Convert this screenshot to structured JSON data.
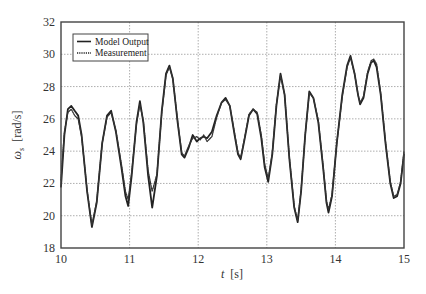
{
  "chart_data": {
    "type": "line",
    "title": "",
    "xlabel_italic": "t",
    "xlabel_unit": "[s]",
    "ylabel_symbol": "ω",
    "ylabel_sub": "s",
    "ylabel_unit": "[rad/s]",
    "xlim": [
      10,
      15
    ],
    "ylim": [
      18,
      32
    ],
    "xticks": [
      10,
      11,
      12,
      13,
      14,
      15
    ],
    "yticks": [
      18,
      20,
      22,
      24,
      26,
      28,
      30,
      32
    ],
    "grid": true,
    "legend_position": "upper left",
    "legend": [
      "Model Output",
      "Measurement"
    ],
    "series": [
      {
        "name": "Model Output",
        "style": "solid",
        "x": [
          10.0,
          10.05,
          10.1,
          10.15,
          10.2,
          10.25,
          10.3,
          10.38,
          10.45,
          10.52,
          10.6,
          10.67,
          10.73,
          10.8,
          10.88,
          10.94,
          10.98,
          11.03,
          11.1,
          11.15,
          11.2,
          11.27,
          11.33,
          11.4,
          11.47,
          11.53,
          11.58,
          11.63,
          11.7,
          11.76,
          11.8,
          11.86,
          11.92,
          11.98,
          12.03,
          12.08,
          12.13,
          12.2,
          12.27,
          12.34,
          12.4,
          12.46,
          12.53,
          12.58,
          12.62,
          12.68,
          12.74,
          12.8,
          12.86,
          12.92,
          12.97,
          13.02,
          13.08,
          13.14,
          13.2,
          13.26,
          13.33,
          13.4,
          13.45,
          13.5,
          13.56,
          13.62,
          13.68,
          13.75,
          13.82,
          13.87,
          13.9,
          13.95,
          14.02,
          14.1,
          14.17,
          14.22,
          14.28,
          14.33,
          14.36,
          14.41,
          14.47,
          14.52,
          14.56,
          14.6,
          14.66,
          14.73,
          14.8,
          14.85,
          14.9,
          14.95,
          15.0
        ],
        "y": [
          21.8,
          25.0,
          26.6,
          26.8,
          26.5,
          26.2,
          25.0,
          21.5,
          19.3,
          20.8,
          24.5,
          26.2,
          26.5,
          25.2,
          23.0,
          21.2,
          20.6,
          22.5,
          25.8,
          27.1,
          25.8,
          22.5,
          20.5,
          22.5,
          26.5,
          28.8,
          29.3,
          28.5,
          25.8,
          23.8,
          23.6,
          24.2,
          25.0,
          24.6,
          24.8,
          24.9,
          24.8,
          25.2,
          26.2,
          27.0,
          27.3,
          26.8,
          25.0,
          23.8,
          23.5,
          24.8,
          26.2,
          26.6,
          26.3,
          24.8,
          23.0,
          22.1,
          23.8,
          26.8,
          28.8,
          27.5,
          23.5,
          20.5,
          19.6,
          21.5,
          25.0,
          27.7,
          27.3,
          25.8,
          23.0,
          20.8,
          20.2,
          21.2,
          24.5,
          27.5,
          29.3,
          29.9,
          28.8,
          27.5,
          26.9,
          27.3,
          28.8,
          29.5,
          29.6,
          29.2,
          27.5,
          24.5,
          22.0,
          21.1,
          21.2,
          22.0,
          23.8
        ]
      },
      {
        "name": "Measurement",
        "style": "dotted",
        "x": [
          10.0,
          10.05,
          10.1,
          10.15,
          10.2,
          10.25,
          10.3,
          10.38,
          10.45,
          10.52,
          10.6,
          10.67,
          10.73,
          10.8,
          10.88,
          10.94,
          10.98,
          11.03,
          11.1,
          11.15,
          11.2,
          11.27,
          11.33,
          11.4,
          11.47,
          11.53,
          11.58,
          11.63,
          11.7,
          11.76,
          11.8,
          11.86,
          11.92,
          11.98,
          12.03,
          12.08,
          12.13,
          12.2,
          12.27,
          12.34,
          12.4,
          12.46,
          12.53,
          12.58,
          12.62,
          12.68,
          12.74,
          12.8,
          12.86,
          12.92,
          12.97,
          13.02,
          13.08,
          13.14,
          13.2,
          13.26,
          13.33,
          13.4,
          13.45,
          13.5,
          13.56,
          13.62,
          13.68,
          13.75,
          13.82,
          13.87,
          13.9,
          13.95,
          14.02,
          14.1,
          14.17,
          14.22,
          14.28,
          14.33,
          14.36,
          14.41,
          14.47,
          14.52,
          14.56,
          14.6,
          14.66,
          14.73,
          14.8,
          14.85,
          14.9,
          14.95,
          15.0
        ],
        "y": [
          22.2,
          25.2,
          26.4,
          26.6,
          26.2,
          26.0,
          24.9,
          21.6,
          19.4,
          20.9,
          24.5,
          26.1,
          26.4,
          25.3,
          23.2,
          21.5,
          21.0,
          22.7,
          25.7,
          26.9,
          25.9,
          22.8,
          21.5,
          22.6,
          26.4,
          28.7,
          29.2,
          28.5,
          25.9,
          23.9,
          23.7,
          24.3,
          24.8,
          24.9,
          24.7,
          25.0,
          24.6,
          24.9,
          26.1,
          27.0,
          27.2,
          26.8,
          25.1,
          23.9,
          23.6,
          24.9,
          26.3,
          26.6,
          26.4,
          25.0,
          23.2,
          22.3,
          23.9,
          26.9,
          28.7,
          27.5,
          23.6,
          20.6,
          19.7,
          21.6,
          25.0,
          27.6,
          27.3,
          25.9,
          23.1,
          20.9,
          20.4,
          21.3,
          24.5,
          27.4,
          29.2,
          29.8,
          28.8,
          27.5,
          27.0,
          27.4,
          28.9,
          29.6,
          29.7,
          29.4,
          27.6,
          24.6,
          22.1,
          21.2,
          21.3,
          22.1,
          24.0
        ]
      }
    ]
  },
  "layout": {
    "plot_left": 61,
    "plot_top": 22,
    "plot_right": 404,
    "plot_bottom": 248
  }
}
